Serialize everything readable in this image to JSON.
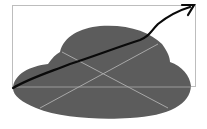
{
  "illustration": {
    "description": "Gray cloud shape inside a frame with crossing light lines and an upward trending arrow",
    "colors": {
      "background": "#ffffff",
      "frame": "#bdbdbd",
      "cloud": "#5c5c5c",
      "cross_lines": "#a8a8a8",
      "arrow": "#0a0a0a"
    },
    "icons": [
      "cloud-shape",
      "trend-arrow-icon",
      "frame-rect"
    ]
  }
}
